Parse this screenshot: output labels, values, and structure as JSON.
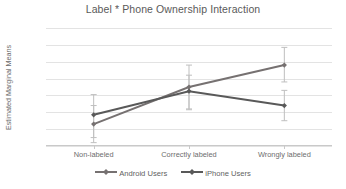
{
  "chart_data": {
    "type": "line",
    "title": "Label * Phone Ownership Interaction",
    "xlabel": "",
    "ylabel": "Estimated Marginal Means",
    "categories": [
      "Non-labeled",
      "Correctly labeled",
      "Wrongly labeled"
    ],
    "ylim": [
      32,
      46
    ],
    "yticks": [
      32,
      34,
      36,
      38,
      40,
      42,
      44,
      46
    ],
    "ytick_labels": [
      "32",
      "34",
      "36",
      "38",
      "40",
      "42",
      "44",
      "46"
    ],
    "grid": "horizontal",
    "legend_position": "bottom",
    "error_bars": true,
    "series": [
      {
        "name": "Android Users",
        "color": "#767171",
        "marker": "diamond",
        "values": [
          34.6,
          39.0,
          41.6
        ],
        "err_low": [
          32.4,
          36.4,
          39.6
        ],
        "err_high": [
          36.8,
          41.6,
          43.7
        ]
      },
      {
        "name": "iPhone Users",
        "color": "#595959",
        "marker": "diamond",
        "values": [
          35.7,
          38.5,
          36.8
        ],
        "err_low": [
          33.0,
          36.3,
          35.0
        ],
        "err_high": [
          38.1,
          40.4,
          38.6
        ]
      }
    ]
  },
  "legend": {
    "items": [
      {
        "label": "Android Users"
      },
      {
        "label": "iPhone Users"
      }
    ]
  },
  "colors": {
    "grid": "#e3e3e3",
    "axis": "#c9c9c9",
    "text": "#6d6d6d",
    "series_1": "#767171",
    "series_2": "#595959",
    "errorbar": "#bfbfbf"
  }
}
